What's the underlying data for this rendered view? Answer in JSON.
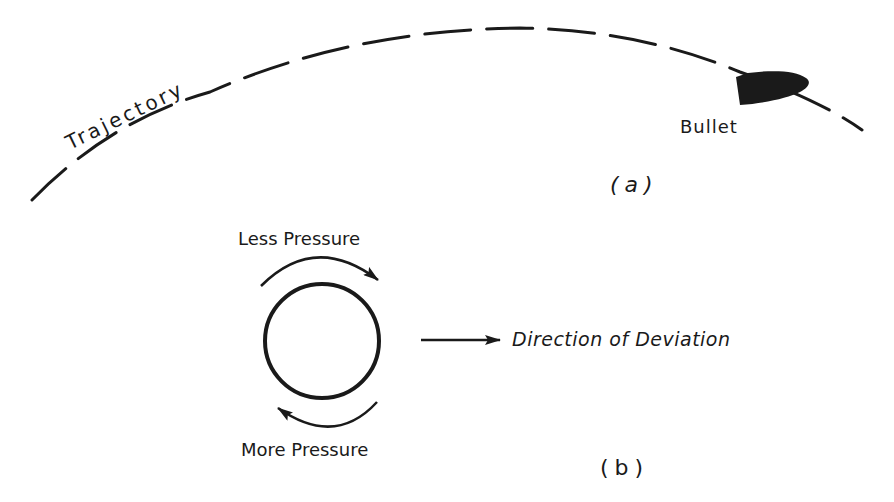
{
  "panel_a": {
    "trajectory_label": "Trajectory",
    "bullet_label": "Bullet",
    "caption": "(a)"
  },
  "panel_b": {
    "top_label": "Less Pressure",
    "bottom_label": "More Pressure",
    "deviation_label": "Direction of Deviation",
    "caption": "(b)"
  },
  "colors": {
    "ink": "#1a1a1a",
    "background": "#ffffff"
  }
}
